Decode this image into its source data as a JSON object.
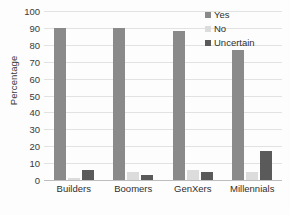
{
  "chart_data": {
    "type": "bar",
    "title": "",
    "xlabel": "",
    "ylabel": "Percentage",
    "ylim": [
      0,
      100
    ],
    "ytick_step": 10,
    "yticks": [
      100,
      90,
      80,
      70,
      60,
      50,
      40,
      30,
      20,
      10,
      0
    ],
    "grid": true,
    "legend_position": "top-right",
    "categories": [
      "Builders",
      "Boomers",
      "GenXers",
      "Millennials"
    ],
    "series": [
      {
        "name": "Yes",
        "color": "#8a8a8a",
        "values": [
          90,
          90,
          88,
          77
        ]
      },
      {
        "name": "No",
        "color": "#dcdcdc",
        "values": [
          1,
          5,
          6,
          5
        ]
      },
      {
        "name": "Uncertain",
        "color": "#5a5a5a",
        "values": [
          6,
          3,
          5,
          17
        ]
      }
    ]
  },
  "legend": {
    "items": [
      {
        "label": "Yes",
        "color": "#8a8a8a"
      },
      {
        "label": "No",
        "color": "#dcdcdc"
      },
      {
        "label": "Uncertain",
        "color": "#5a5a5a"
      }
    ]
  },
  "colors": {
    "gridline": "#e2e2e2",
    "axis": "#bdbdbd",
    "text": "#2f2f2f",
    "background": "#fdfdfd"
  }
}
